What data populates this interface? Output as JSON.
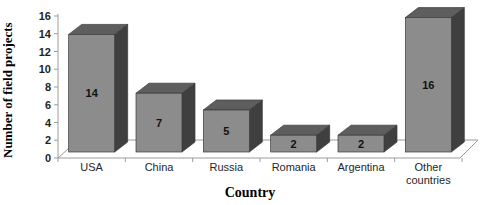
{
  "figure": {
    "kind": "3d-bar-chart-figure"
  },
  "chart_data": {
    "type": "bar",
    "projection": "3d",
    "title": "",
    "xlabel": "Country",
    "ylabel": "Number of field projects",
    "categories": [
      "USA",
      "China",
      "Russia",
      "Romania",
      "Argentina",
      "Other countries"
    ],
    "values": [
      14,
      7,
      5,
      2,
      2,
      16
    ],
    "data_labels": [
      "14",
      "7",
      "5",
      "2",
      "2",
      "16"
    ],
    "ylim": [
      0,
      16
    ],
    "ytick_step": 2,
    "yticks": [
      0,
      2,
      4,
      6,
      8,
      10,
      12,
      14,
      16
    ],
    "grid": false,
    "legend": "none",
    "colors": {
      "bar_front": "#8c8c8c",
      "bar_top": "#5e5e5e",
      "bar_side": "#3f3f3f",
      "bar_outline": "#3a3a3a",
      "axis_line": "#9c9c9c",
      "text": "#1f1f1f",
      "background": "#ffffff"
    }
  }
}
